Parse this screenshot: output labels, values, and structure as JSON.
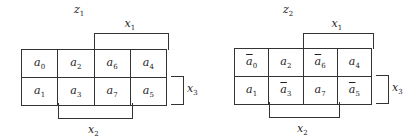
{
  "maps": [
    {
      "title": "z1",
      "title_sub": "1",
      "cells": [
        [
          "a",
          "0",
          false
        ],
        [
          "a",
          "2",
          false
        ],
        [
          "a",
          "6",
          false
        ],
        [
          "a",
          "4",
          false
        ],
        [
          "a",
          "1",
          false
        ],
        [
          "a",
          "3",
          false
        ],
        [
          "a",
          "7",
          false
        ],
        [
          "a",
          "5",
          false
        ]
      ]
    },
    {
      "title": "z2",
      "title_sub": "2",
      "cells": [
        [
          "a",
          "0",
          true
        ],
        [
          "a",
          "2",
          false
        ],
        [
          "a",
          "6",
          true
        ],
        [
          "a",
          "4",
          false
        ],
        [
          "a",
          "1",
          false
        ],
        [
          "a",
          "3",
          true
        ],
        [
          "a",
          "7",
          false
        ],
        [
          "a",
          "5",
          true
        ]
      ]
    }
  ],
  "labels": {
    "x1": "x",
    "x1_sub": "1",
    "x2": "x",
    "x2_sub": "2",
    "x3": "x",
    "x3_sub": "3",
    "z": "z"
  }
}
